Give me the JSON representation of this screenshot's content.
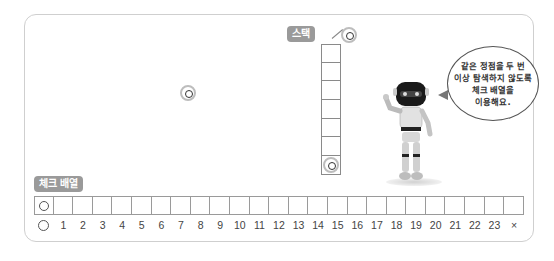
{
  "stack": {
    "label": "스택",
    "cell_count": 7,
    "incoming_node": "vertex",
    "bottom_cell": "vertex"
  },
  "check_array": {
    "label": "체크 배열",
    "indices": [
      "○",
      "1",
      "2",
      "3",
      "4",
      "5",
      "6",
      "7",
      "8",
      "9",
      "10",
      "11",
      "12",
      "13",
      "14",
      "15",
      "16",
      "17",
      "18",
      "19",
      "20",
      "21",
      "22",
      "23",
      "×"
    ],
    "first_cell_marked": "○"
  },
  "canvas": {
    "free_node": "vertex"
  },
  "speech_bubble": {
    "lines": [
      "같은 정점을 두 번",
      "이상 탐색하지 않도록",
      "체크 배열을",
      "이용해요."
    ]
  },
  "robot": {
    "description": "robot character"
  },
  "colors": {
    "tag_bg": "#9a9a9a",
    "frame_border": "#cfcfcf",
    "cell_border": "#8a8a8a"
  }
}
